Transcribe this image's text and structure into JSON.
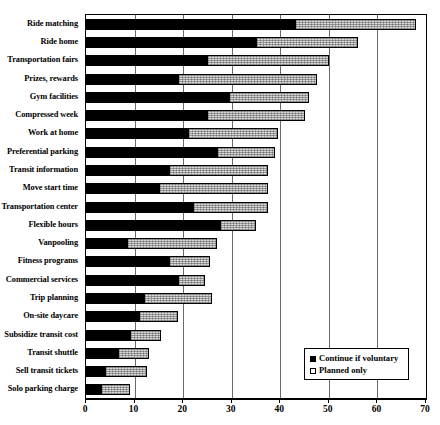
{
  "chart_data": {
    "type": "bar",
    "orientation": "horizontal",
    "stacked": true,
    "title": "",
    "subtitle": "",
    "xlabel": "",
    "ylabel": "",
    "xlim": [
      0,
      70
    ],
    "xticks": [
      0,
      10,
      20,
      30,
      40,
      50,
      60,
      70
    ],
    "grid": true,
    "grid_axis": "x",
    "legend_position": "bottom-right",
    "categories": [
      "Ride matching",
      "Ride home",
      "Transportation fairs",
      "Prizes, rewards",
      "Gym facilities",
      "Compressed week",
      "Work at home",
      "Preferential parking",
      "Transit information",
      "Move start time",
      "Transportation center",
      "Flexible hours",
      "Vanpooling",
      "Fitness programs",
      "Commercial services",
      "Trip planning",
      "On-site daycare",
      "Subsidize transit cost",
      "Transit shuttle",
      "Sell transit tickets",
      "Solo parking charge"
    ],
    "series": [
      {
        "name": "Continue if voluntary",
        "color": "#000000",
        "swatch": "filled-square",
        "values": [
          43,
          35,
          25,
          19,
          29.5,
          25,
          21,
          27,
          17,
          15,
          22,
          27.5,
          8.5,
          17,
          19,
          12,
          11,
          9,
          6.5,
          4,
          3
        ]
      },
      {
        "name": "Planned only",
        "color": "#d8d8d8",
        "swatch": "open-square",
        "values": [
          25,
          21,
          25,
          28.5,
          16.5,
          20,
          18.5,
          12,
          20.5,
          22.5,
          15.5,
          7.5,
          18.5,
          8.5,
          5.5,
          14,
          8,
          6.5,
          6.5,
          8.5,
          6
        ]
      }
    ],
    "totals": [
      68,
      56,
      50,
      47.5,
      46,
      45,
      39.5,
      39,
      37.5,
      37.5,
      37.5,
      35,
      27,
      25.5,
      24.5,
      26,
      19,
      15.5,
      13,
      12.5,
      9
    ]
  },
  "legend": {
    "items": [
      {
        "label": "Continue if voluntary",
        "swatch": "filled-square"
      },
      {
        "label": "Planned only",
        "swatch": "open-square"
      }
    ]
  },
  "axis": {
    "tick_labels": [
      "0",
      "10",
      "20",
      "30",
      "40",
      "50",
      "60",
      "70"
    ]
  }
}
